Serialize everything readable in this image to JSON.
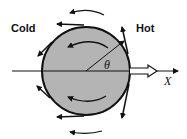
{
  "diagram": {
    "labels": {
      "cold": "Cold",
      "hot": "Hot",
      "angle": "θ",
      "axis": "X"
    },
    "colors": {
      "sphere_fill": "#b4b4b4",
      "stroke": "#111111",
      "background": "#ffffff"
    },
    "sphere": {
      "cx": 86,
      "cy": 71,
      "r": 44
    }
  }
}
